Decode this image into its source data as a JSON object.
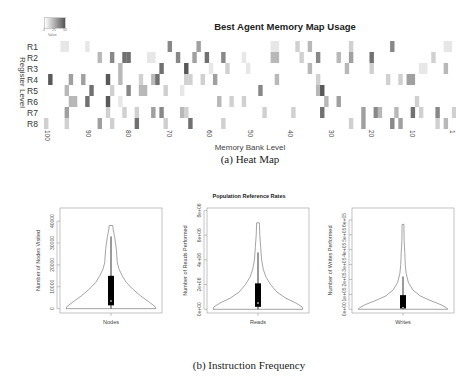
{
  "figure": {
    "caption_a": "(a) Heat Map",
    "caption_b": "(b) Instruction Frequency"
  },
  "chart_data": [
    {
      "type": "heatmap",
      "title": "Best Agent Memory Map Usage",
      "xlabel": "Memory Bank Level",
      "ylabel": "Register Level",
      "row_labels": [
        "R1",
        "R2",
        "R3",
        "R4",
        "R5",
        "R6",
        "R7",
        "R8"
      ],
      "x_tick_labels": [
        "100",
        "90",
        "80",
        "70",
        "60",
        "50",
        "40",
        "30",
        "20",
        "10",
        "1"
      ],
      "x_range": [
        100,
        1
      ],
      "legend": {
        "label": "Value",
        "ticks": [
          "0",
          "25",
          "50"
        ],
        "colors": [
          "#ffffff",
          "#555555"
        ]
      },
      "grid_note": "Approximate relative intensities (0-1), 8 rows x 100 columns, ordered left (100) to right (1)",
      "intensity": [
        "0000110000100000000000000000005000000400000000000000000110000200300000000020000000005000000000000110",
        "0000000000000300500660000110000050004006000500001000000330000020005000030040000600000000000000200000",
        "0000000000000000003000000000600000700000100020000100000000000000300000000300000200000000000110000300",
        "0700004004000007003000020036000000220020040000000000000030000000002000000000000000020020440000000000",
        "0000030000060000200050033000020001000000000000000000500000000000003700000000000000000000000000000000",
        "0000003300600007001000000000000000000000003002002000000000000000000030040000000000000000002000000000",
        "0000040000000002000200200040500003200000000000000000020000002000000600000000040053000300060200050002",
        "2000020000000400200000600000020000060000000200000000000000000000000000000020040000005040000000020300"
      ]
    },
    {
      "type": "violin",
      "title": "Population Reference Rates",
      "panels": [
        {
          "name": "Nodes",
          "xlabel": "Nodes",
          "ylabel": "Number of Nodes Visited",
          "yticks": [
            "0",
            "10000",
            "20000",
            "30000",
            "40000"
          ],
          "ytick_values": [
            0,
            10000,
            20000,
            30000,
            40000
          ],
          "ylim": [
            -2000,
            46000
          ],
          "box": {
            "q1": 1500,
            "median": 3500,
            "q3": 15000,
            "whisker_low": 0,
            "whisker_high": 33000,
            "max": 38000
          },
          "profile": [
            [
              0,
              1.0
            ],
            [
              1000,
              0.98
            ],
            [
              3000,
              0.85
            ],
            [
              6000,
              0.65
            ],
            [
              9000,
              0.48
            ],
            [
              12000,
              0.34
            ],
            [
              15000,
              0.25
            ],
            [
              18000,
              0.18
            ],
            [
              21000,
              0.14
            ],
            [
              24000,
              0.13
            ],
            [
              27000,
              0.12
            ],
            [
              30000,
              0.1
            ],
            [
              33000,
              0.08
            ],
            [
              36000,
              0.05
            ],
            [
              38000,
              0.04
            ]
          ]
        },
        {
          "name": "Reads",
          "xlabel": "Reads",
          "ylabel": "Number of Reads Performed",
          "yticks": [
            "0e+00",
            "2e+06",
            "4e+06",
            "6e+06",
            "8e+06"
          ],
          "ytick_values": [
            0,
            2000000,
            4000000,
            6000000,
            8000000
          ],
          "ylim": [
            -300000,
            8200000
          ],
          "box": {
            "q1": 200000,
            "median": 500000,
            "q3": 2100000,
            "whisker_low": 0,
            "whisker_high": 4600000,
            "max": 7000000
          },
          "profile": [
            [
              0,
              1.0
            ],
            [
              200000,
              0.98
            ],
            [
              500000,
              0.85
            ],
            [
              900000,
              0.62
            ],
            [
              1400000,
              0.42
            ],
            [
              2000000,
              0.28
            ],
            [
              2600000,
              0.18
            ],
            [
              3200000,
              0.12
            ],
            [
              4000000,
              0.08
            ],
            [
              5000000,
              0.06
            ],
            [
              6000000,
              0.04
            ],
            [
              7000000,
              0.03
            ]
          ]
        },
        {
          "name": "Writes",
          "xlabel": "Writes",
          "ylabel": "Number of Writes Performed",
          "yticks": [
            "0e+00",
            "1e+05",
            "2e+05",
            "3e+05",
            "4e+05",
            "5e+05",
            "6e+05"
          ],
          "ytick_values": [
            0,
            100000,
            200000,
            300000,
            400000,
            500000,
            600000
          ],
          "ylim": [
            -25000,
            680000
          ],
          "box": {
            "q1": 5000,
            "median": 10000,
            "q3": 95000,
            "whisker_low": 0,
            "whisker_high": 220000,
            "max": 570000
          },
          "profile": [
            [
              0,
              1.0
            ],
            [
              10000,
              0.97
            ],
            [
              30000,
              0.85
            ],
            [
              60000,
              0.6
            ],
            [
              90000,
              0.38
            ],
            [
              130000,
              0.22
            ],
            [
              180000,
              0.12
            ],
            [
              240000,
              0.07
            ],
            [
              300000,
              0.05
            ],
            [
              380000,
              0.04
            ],
            [
              460000,
              0.025
            ],
            [
              570000,
              0.02
            ]
          ]
        }
      ]
    }
  ]
}
